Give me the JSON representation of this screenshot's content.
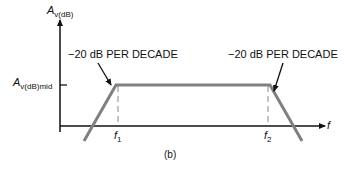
{
  "figure": {
    "caption": "(b)",
    "y_axis_label": {
      "main": "A",
      "sub": "v(dB)"
    },
    "mid_label": {
      "main": "A",
      "sub": "v(dB)mid"
    },
    "x_axis_label": "f",
    "f1_label": {
      "main": "f",
      "sub": "1"
    },
    "f2_label": {
      "main": "f",
      "sub": "2"
    },
    "left_annotation": "−20 dB PER DECADE",
    "right_annotation": "−20 dB PER DECADE",
    "curve_color": "#808080",
    "axis_color": "#111111"
  }
}
